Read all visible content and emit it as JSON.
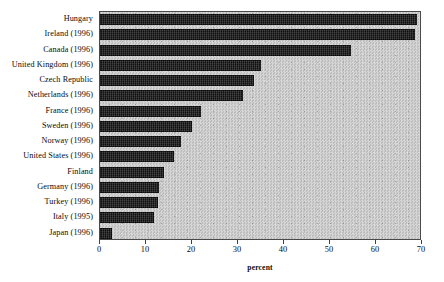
{
  "chart_data": {
    "type": "bar",
    "orientation": "horizontal",
    "title": "",
    "subtitle": "",
    "xlabel": "percent",
    "ylabel": "",
    "xlim": [
      0,
      70
    ],
    "xticks": [
      0,
      10,
      20,
      30,
      40,
      50,
      60,
      70
    ],
    "grid": false,
    "legend": null,
    "categories": [
      "Hungary",
      "Ireland (1996)",
      "Canada (1996)",
      "United Kingdom  (1996)",
      "Czech Republic",
      "Netherlands (1996)",
      "France (1996)",
      "Sweden (1996)",
      "Norway (1996)",
      "United States (1996)",
      "Finland",
      "Germany (1996)",
      "Turkey (1996)",
      "Italy (1995)",
      "Japan (1996)"
    ],
    "values": [
      69,
      68.5,
      54.5,
      35,
      33.5,
      31,
      22,
      20,
      17.5,
      16,
      14,
      12.8,
      12.5,
      11.7,
      2.5
    ],
    "bar_color": "#1d1d1d",
    "plot_background_color": "#c9c9c9",
    "axis_color": "#4a4a4a"
  }
}
